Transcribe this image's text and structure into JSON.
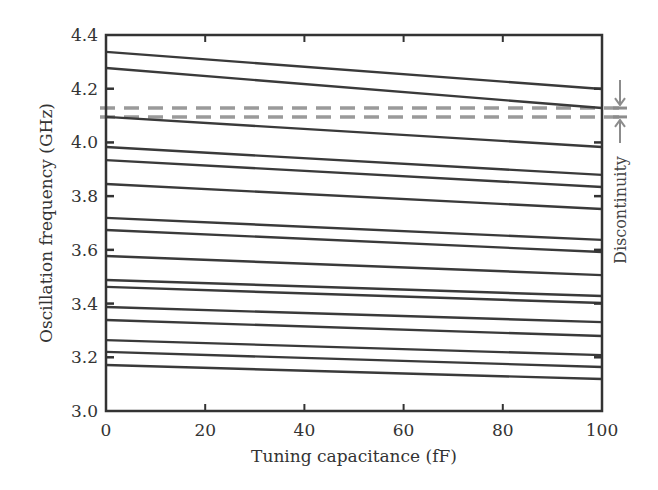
{
  "chart_data": {
    "type": "line",
    "title": "",
    "xlabel": "Tuning capacitance (fF)",
    "ylabel": "Oscillation frequency (GHz)",
    "xlim": [
      0,
      100
    ],
    "ylim": [
      3.0,
      4.4
    ],
    "x_ticks": [
      0,
      20,
      40,
      60,
      80,
      100
    ],
    "x_tick_labels": [
      "0",
      "20",
      "40",
      "60",
      "80",
      "100"
    ],
    "y_ticks": [
      3.0,
      3.2,
      3.4,
      3.6,
      3.8,
      4.0,
      4.2,
      4.4
    ],
    "y_tick_labels": [
      "3.0",
      "3.2",
      "3.4",
      "3.6",
      "3.8",
      "4.0",
      "4.2",
      "4.4"
    ],
    "grid": false,
    "legend": "none",
    "line_color": "#3a3a3a",
    "dashed_color": "#9a9a9a",
    "x": [
      0,
      100
    ],
    "series": [
      {
        "name": "band-1",
        "values": [
          4.337,
          4.199
        ]
      },
      {
        "name": "band-2",
        "values": [
          4.277,
          4.128
        ]
      },
      {
        "name": "band-3",
        "values": [
          4.095,
          3.983
        ]
      },
      {
        "name": "band-4",
        "values": [
          3.983,
          3.879
        ]
      },
      {
        "name": "band-5",
        "values": [
          3.934,
          3.834
        ]
      },
      {
        "name": "band-6",
        "values": [
          3.845,
          3.752
        ]
      },
      {
        "name": "band-7",
        "values": [
          3.719,
          3.637
        ]
      },
      {
        "name": "band-8",
        "values": [
          3.674,
          3.592
        ]
      },
      {
        "name": "band-9",
        "values": [
          3.577,
          3.506
        ]
      },
      {
        "name": "band-10",
        "values": [
          3.488,
          3.428
        ]
      },
      {
        "name": "band-11",
        "values": [
          3.462,
          3.402
        ]
      },
      {
        "name": "band-12",
        "values": [
          3.387,
          3.331
        ]
      },
      {
        "name": "band-13",
        "values": [
          3.339,
          3.279
        ]
      },
      {
        "name": "band-14",
        "values": [
          3.264,
          3.208
        ]
      },
      {
        "name": "band-15",
        "values": [
          3.22,
          3.164
        ]
      },
      {
        "name": "band-16",
        "values": [
          3.171,
          3.119
        ]
      }
    ],
    "reference_lines": [
      {
        "name": "discontinuity-upper",
        "y": 4.128,
        "style": "dashed"
      },
      {
        "name": "discontinuity-lower",
        "y": 4.095,
        "style": "dashed"
      }
    ],
    "annotations": [
      {
        "text": "Discontinuity",
        "position": "right",
        "between": [
          4.095,
          4.128
        ]
      }
    ]
  }
}
